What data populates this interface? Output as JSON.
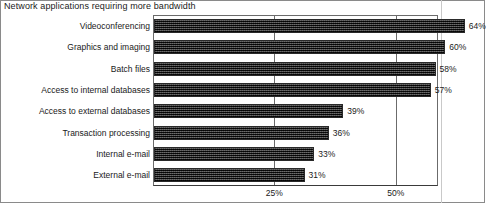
{
  "chart_data": {
    "type": "bar",
    "orientation": "horizontal",
    "title": "Network applications requiring more bandwidth",
    "xlabel": "",
    "ylabel": "",
    "categories": [
      "Videoconferencing",
      "Graphics and imaging",
      "Batch files",
      "Access to internal databases",
      "Access to external databases",
      "Transaction processing",
      "Internal e-mail",
      "External e-mail"
    ],
    "values": [
      64,
      60,
      58,
      57,
      39,
      36,
      33,
      31
    ],
    "value_labels": [
      "64%",
      "60%",
      "58%",
      "57%",
      "39%",
      "36%",
      "33%",
      "31%"
    ],
    "xlim": [
      0,
      58.6
    ],
    "tick_values": [
      25,
      50
    ],
    "tick_labels": [
      "25%",
      "50%"
    ],
    "grid": true,
    "legend": null,
    "bar_color": "#3d3d3d",
    "text_color": "#1a1a1a",
    "frame_color": "#6b6b6b",
    "background": "#ffffff"
  }
}
